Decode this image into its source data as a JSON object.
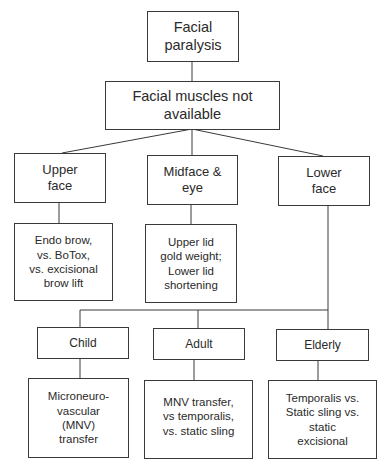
{
  "diagram": {
    "root": {
      "label": "Facial paralysis",
      "lines": [
        "Facial",
        "paralysis"
      ]
    },
    "level1": {
      "label": "Facial muscles not available",
      "lines": [
        "Facial muscles not",
        "available"
      ]
    },
    "regions": [
      {
        "label": "Upper face",
        "lines": [
          "Upper",
          "face"
        ],
        "treatment": {
          "lines": [
            "Endo brow,",
            "vs. BoTox,",
            "vs. excisional",
            "brow lift"
          ]
        }
      },
      {
        "label": "Midface & eye",
        "lines": [
          "Midface &",
          "eye"
        ],
        "treatment": {
          "lines": [
            "Upper lid",
            "gold weight;",
            "Lower lid",
            "shortening"
          ]
        }
      },
      {
        "label": "Lower face",
        "lines": [
          "Lower",
          "face"
        ]
      }
    ],
    "age_groups": [
      {
        "label": "Child",
        "treatment": {
          "lines": [
            "Microneuro-",
            "vascular",
            "(MNV)",
            "transfer"
          ]
        }
      },
      {
        "label": "Adult",
        "treatment": {
          "lines": [
            "MNV transfer,",
            "vs temporalis,",
            "vs. static sling"
          ]
        }
      },
      {
        "label": "Elderly",
        "treatment": {
          "lines": [
            "Temporalis vs.",
            "Static sling vs.",
            "static",
            "excisional"
          ]
        }
      }
    ]
  }
}
